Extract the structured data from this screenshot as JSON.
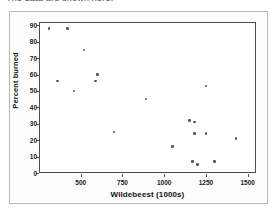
{
  "page": {
    "top_text": "The data are shown here:"
  },
  "chart_data": {
    "type": "scatter",
    "title": "",
    "xlabel": "Wildebeest (1000s)",
    "ylabel": "Percent burned",
    "xlim": [
      250,
      1550
    ],
    "ylim": [
      0,
      92
    ],
    "xticks": [
      500,
      750,
      1000,
      1250,
      1500
    ],
    "yticks": [
      0,
      10,
      20,
      30,
      40,
      50,
      60,
      70,
      80,
      90
    ],
    "xtick_labels": [
      "500",
      "750",
      "1000",
      "1250",
      "1500"
    ],
    "ytick_labels": [
      "0",
      "10",
      "20",
      "30",
      "40",
      "50",
      "60",
      "70",
      "80",
      "90"
    ],
    "grid": false,
    "legend": null,
    "marker_color": "#555558",
    "axis_color": "#4e4e4e",
    "points": [
      {
        "x": 310,
        "y": 88
      },
      {
        "x": 420,
        "y": 88
      },
      {
        "x": 520,
        "y": 75
      },
      {
        "x": 600,
        "y": 60
      },
      {
        "x": 590,
        "y": 56
      },
      {
        "x": 360,
        "y": 56
      },
      {
        "x": 460,
        "y": 50
      },
      {
        "x": 890,
        "y": 45
      },
      {
        "x": 1250,
        "y": 53
      },
      {
        "x": 1150,
        "y": 32
      },
      {
        "x": 1180,
        "y": 31
      },
      {
        "x": 1180,
        "y": 24
      },
      {
        "x": 1250,
        "y": 24
      },
      {
        "x": 700,
        "y": 25
      },
      {
        "x": 1050,
        "y": 16
      },
      {
        "x": 1170,
        "y": 7
      },
      {
        "x": 1300,
        "y": 7
      },
      {
        "x": 1200,
        "y": 5
      },
      {
        "x": 1430,
        "y": 21
      }
    ]
  }
}
